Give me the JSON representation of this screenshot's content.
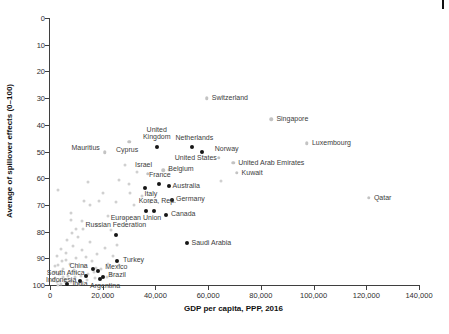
{
  "figure": {
    "corner_mark": "page-edge-mark"
  },
  "chart_data": {
    "type": "scatter",
    "title": "",
    "xlabel": "GDP per capita, PPP, 2016",
    "ylabel": "Average of spillover effects (0–100)",
    "xlim": [
      0,
      140000
    ],
    "ylim": [
      0,
      100
    ],
    "y_inverted": true,
    "grid": false,
    "legend": "none",
    "x_ticks": [
      0,
      20000,
      40000,
      60000,
      80000,
      100000,
      120000,
      140000
    ],
    "x_tick_labels": [
      "0",
      "20,000",
      "40,000",
      "60,000",
      "80,000",
      "100,000",
      "120,000",
      "140,000"
    ],
    "y_ticks": [
      0,
      10,
      20,
      30,
      40,
      50,
      60,
      70,
      80,
      90,
      100
    ],
    "y_tick_labels": [
      "0",
      "10",
      "20",
      "30",
      "40",
      "50",
      "60",
      "70",
      "80",
      "90",
      "100"
    ],
    "colors": {
      "highlight_marker": "#161616",
      "context_marker": "#c3c3c3",
      "background_marker": "#d0d0d0",
      "label_text": "#3c3c3c"
    },
    "series": [
      {
        "name": "labeled_highlight_countries",
        "marker": "filled-dark",
        "points": [
          {
            "label": "United\nKingdom",
            "x": 40500,
            "y": 48.2,
            "side": "above",
            "dx": 0,
            "dy": -2
          },
          {
            "label": "Netherlands",
            "x": 54000,
            "y": 48.2,
            "side": "above",
            "dx": 2,
            "dy": -1
          },
          {
            "label": "United States",
            "x": 57600,
            "y": 50.2,
            "side": "below",
            "dx": -6,
            "dy": -1
          },
          {
            "label": "France",
            "x": 41300,
            "y": 62.1,
            "side": "above",
            "dx": 1,
            "dy": -1
          },
          {
            "label": "Italy",
            "x": 36000,
            "y": 63.5,
            "side": "below",
            "dx": 6,
            "dy": -1
          },
          {
            "label": "Australia",
            "x": 45000,
            "y": 62.8,
            "side": "right",
            "dx": 0,
            "dy": 0
          },
          {
            "label": "Germany",
            "x": 46300,
            "y": 68.0,
            "side": "right",
            "dx": 0,
            "dy": -1
          },
          {
            "label": "Korea, Rep.",
            "x": 39600,
            "y": 72.3,
            "side": "above",
            "dx": 3,
            "dy": -2
          },
          {
            "label": "European Union",
            "x": 36400,
            "y": 72.3,
            "side": "below",
            "dx": -10,
            "dy": 0
          },
          {
            "label": "Canada",
            "x": 44000,
            "y": 73.8,
            "side": "right",
            "dx": 1,
            "dy": -1
          },
          {
            "label": "Russian Federation",
            "x": 25000,
            "y": 81.2,
            "side": "above",
            "dx": 0,
            "dy": -2
          },
          {
            "label": "Saudi Arabia",
            "x": 51800,
            "y": 84.3,
            "side": "right",
            "dx": 1,
            "dy": 0
          },
          {
            "label": "Turkey",
            "x": 25400,
            "y": 90.9,
            "side": "right",
            "dx": 2,
            "dy": -1
          },
          {
            "label": "China",
            "x": 16200,
            "y": 94.1,
            "side": "left",
            "dx": -1,
            "dy": -3
          },
          {
            "label": "Mexico",
            "x": 18300,
            "y": 94.8,
            "side": "right",
            "dx": 3,
            "dy": -4
          },
          {
            "label": "South Africa",
            "x": 13500,
            "y": 96.8,
            "side": "left",
            "dx": 3,
            "dy": -3
          },
          {
            "label": "Brazil",
            "x": 20200,
            "y": 96.9,
            "side": "right",
            "dx": 1,
            "dy": -2
          },
          {
            "label": "Indonesia",
            "x": 11500,
            "y": 98.4,
            "side": "left",
            "dx": 0,
            "dy": -1
          },
          {
            "label": "India",
            "x": 6600,
            "y": 99.7,
            "side": "right",
            "dx": 1,
            "dy": 0
          },
          {
            "label": "Argentina",
            "x": 19000,
            "y": 97.8,
            "side": "below",
            "dx": 5,
            "dy": 0
          }
        ]
      },
      {
        "name": "labeled_context_countries",
        "marker": "light-gray",
        "points": [
          {
            "label": "Switzerland",
            "x": 59500,
            "y": 30.1,
            "side": "right",
            "dx": 1,
            "dy": 0
          },
          {
            "label": "Singapore",
            "x": 84000,
            "y": 37.9,
            "side": "right",
            "dx": 1,
            "dy": 0
          },
          {
            "label": "Luxembourg",
            "x": 97500,
            "y": 46.9,
            "side": "right",
            "dx": 1,
            "dy": 0
          },
          {
            "label": "Norway",
            "x": 64000,
            "y": 52.3,
            "side": "above",
            "dx": 8,
            "dy": -1
          },
          {
            "label": "United Arab Emirates",
            "x": 69500,
            "y": 54.3,
            "side": "right",
            "dx": 1,
            "dy": 0
          },
          {
            "label": "Kuwait",
            "x": 70800,
            "y": 57.9,
            "side": "right",
            "dx": 1,
            "dy": 0
          },
          {
            "label": "Qatar",
            "x": 121000,
            "y": 67.4,
            "side": "right",
            "dx": 1,
            "dy": 0
          },
          {
            "label": "Mauritius",
            "x": 20800,
            "y": 50.3,
            "side": "left",
            "dx": -1,
            "dy": -4
          },
          {
            "label": "Cyprus",
            "x": 30000,
            "y": 46.3,
            "side": "below",
            "dx": -2,
            "dy": 1
          },
          {
            "label": "Israel",
            "x": 37000,
            "y": 58.4,
            "side": "above",
            "dx": -4,
            "dy": -1
          },
          {
            "label": "Belgium",
            "x": 43000,
            "y": 57.1,
            "side": "right",
            "dx": 1,
            "dy": -1
          }
        ]
      },
      {
        "name": "unlabeled_background_countries",
        "marker": "light-gray-small",
        "points": [
          [
            1500,
            95
          ],
          [
            2000,
            97.5
          ],
          [
            2600,
            99
          ],
          [
            3000,
            92.5
          ],
          [
            3600,
            96
          ],
          [
            4000,
            99.5
          ],
          [
            4600,
            91
          ],
          [
            5000,
            94
          ],
          [
            5600,
            98
          ],
          [
            6000,
            88
          ],
          [
            7000,
            96.5
          ],
          [
            7600,
            92
          ],
          [
            8000,
            99
          ],
          [
            8600,
            85.5
          ],
          [
            9000,
            94.5
          ],
          [
            9600,
            97
          ],
          [
            10000,
            90
          ],
          [
            11000,
            99.5
          ],
          [
            12000,
            87
          ],
          [
            13000,
            93
          ],
          [
            14000,
            98
          ],
          [
            15000,
            84
          ],
          [
            16000,
            91
          ],
          [
            17000,
            97.5
          ],
          [
            18000,
            88.5
          ],
          [
            19500,
            94
          ],
          [
            21000,
            86
          ],
          [
            22000,
            92
          ],
          [
            23000,
            96
          ],
          [
            2800,
            89
          ],
          [
            4200,
            86.5
          ],
          [
            6600,
            83
          ],
          [
            8200,
            80.5
          ],
          [
            10600,
            82
          ],
          [
            12600,
            79
          ],
          [
            3200,
            100
          ],
          [
            5800,
            99
          ],
          [
            7800,
            98
          ],
          [
            9800,
            95.5
          ],
          [
            1200,
            98
          ],
          [
            1800,
            93
          ],
          [
            2200,
            95
          ],
          [
            16600,
            95
          ],
          [
            13600,
            89.5
          ],
          [
            11600,
            96.5
          ],
          [
            24000,
            89
          ],
          [
            26000,
            92.5
          ],
          [
            6200,
            90.5
          ],
          [
            4800,
            97
          ],
          [
            3800,
            98.5
          ],
          [
            14600,
            96
          ],
          [
            17600,
            93.5
          ],
          [
            25500,
            85
          ],
          [
            21500,
            97
          ],
          [
            8000,
            73
          ],
          [
            12000,
            76
          ],
          [
            15000,
            70
          ],
          [
            18000,
            77.5
          ],
          [
            20000,
            65.5
          ],
          [
            22000,
            74
          ],
          [
            25000,
            69
          ],
          [
            28000,
            75
          ],
          [
            30000,
            62
          ],
          [
            32000,
            70
          ],
          [
            35000,
            66.5
          ],
          [
            13000,
            68.5
          ],
          [
            26000,
            60.5
          ],
          [
            38000,
            69
          ],
          [
            14300,
            61.5
          ],
          [
            2900,
            64.5
          ],
          [
            30200,
            65.5
          ],
          [
            10000,
            79
          ],
          [
            23000,
            79.5
          ],
          [
            65000,
            61
          ],
          [
            45000,
            57
          ],
          [
            33000,
            57.5
          ],
          [
            28500,
            55
          ],
          [
            18600,
            68.5
          ],
          [
            7900,
            75.5
          ]
        ]
      }
    ]
  }
}
